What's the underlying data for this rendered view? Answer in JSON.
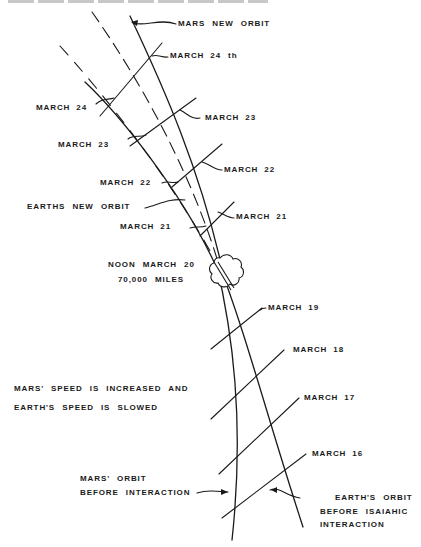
{
  "diagram": {
    "type": "orbital interaction diagram",
    "labels": {
      "mars_new_orbit": "MARS  NEW  ORBIT",
      "earths_new_orbit": "EARTHS  NEW  ORBIT",
      "noon_event": "NOON  MARCH  20",
      "distance": "70,000  MILES",
      "speed_note_line1": "MARS' SPEED  IS  INCREASED  AND",
      "speed_note_line2": "EARTH'S   SPEED  IS  SLOWED",
      "mars_orbit_before_line1": "MARS'  ORBIT",
      "mars_orbit_before_line2": "BEFORE   INTERACTION",
      "earth_orbit_before_line1": "EARTH'S   ORBIT",
      "earth_orbit_before_line2": "BEFORE   ISAIAHIC",
      "earth_orbit_before_line3": "INTERACTION"
    },
    "date_markers_right": [
      {
        "month": "MARCH",
        "day": "24 th"
      },
      {
        "month": "MARCH",
        "day": "23"
      },
      {
        "month": "MARCH",
        "day": "22"
      },
      {
        "month": "MARCH",
        "day": "21"
      },
      {
        "month": "MARCH",
        "day": "19"
      },
      {
        "month": "MARCH",
        "day": "18"
      },
      {
        "month": "MARCH",
        "day": "17"
      },
      {
        "month": "MARCH",
        "day": "16"
      }
    ],
    "date_markers_left": [
      {
        "month": "MARCH",
        "day": "24"
      },
      {
        "month": "MARCH",
        "day": "23"
      },
      {
        "month": "MARCH",
        "day": "22"
      },
      {
        "month": "MARCH",
        "day": "21"
      }
    ],
    "colors": {
      "ink": "#1a1a1a",
      "paper": "#ffffff"
    }
  }
}
